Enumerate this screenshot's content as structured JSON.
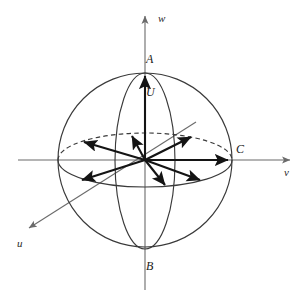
{
  "figure": {
    "background_color": "#ffffff",
    "stroke_color": "#3a3a3a",
    "axis_color": "#6b6b6b",
    "vector_color": "#1a1a1a"
  },
  "axes": [
    {
      "id": "w",
      "label": "w",
      "label_x": 160,
      "label_y": 20,
      "x1": 145,
      "y1": 290,
      "x2": 145,
      "y2": 14,
      "arrow": "up"
    },
    {
      "id": "v",
      "label": "v",
      "label_x": 287,
      "label_y": 175,
      "x1": 18,
      "y1": 160,
      "x2": 292,
      "y2": 160,
      "arrow": "right"
    },
    {
      "id": "u",
      "label": "u",
      "label_x": 19,
      "label_y": 246,
      "x1": 196,
      "y1": 122,
      "x2": 27,
      "y2": 229,
      "arrow": "down-left"
    }
  ],
  "sphere": {
    "center_x": 145,
    "center_y": 160,
    "radius": 87,
    "equator": {
      "rx": 87,
      "ry": 27,
      "back_half": "dashed",
      "front_half": "solid"
    },
    "meridian": {
      "rx": 30,
      "ry": 88,
      "style": "solid"
    }
  },
  "labels": [
    {
      "id": "A",
      "text": "A",
      "x": 147,
      "y": 61,
      "desc": "north-pole-label"
    },
    {
      "id": "U",
      "text": "U",
      "x": 147,
      "y": 94,
      "desc": "vector-U-label"
    },
    {
      "id": "B",
      "text": "B",
      "x": 147,
      "y": 268,
      "desc": "south-pole-label"
    },
    {
      "id": "C",
      "text": "C",
      "x": 236,
      "y": 152,
      "desc": "equator-point-label"
    }
  ],
  "vectors": [
    {
      "id": "U",
      "name": "vector-up-U",
      "x2": 145,
      "y2": 73
    },
    {
      "id": "C",
      "name": "vector-right-C",
      "x2": 231,
      "y2": 160
    },
    {
      "id": "v1",
      "name": "vector-upper-left",
      "x2": 81,
      "y2": 141
    },
    {
      "id": "v2",
      "name": "vector-upper-right",
      "x2": 193,
      "y2": 134
    },
    {
      "id": "v3",
      "name": "vector-up-near",
      "x2": 131,
      "y2": 133
    },
    {
      "id": "v4",
      "name": "vector-lower-left",
      "x2": 79,
      "y2": 182
    },
    {
      "id": "v5",
      "name": "vector-down-near",
      "x2": 166,
      "y2": 188
    },
    {
      "id": "v6",
      "name": "vector-lower-right",
      "x2": 203,
      "y2": 182
    }
  ]
}
